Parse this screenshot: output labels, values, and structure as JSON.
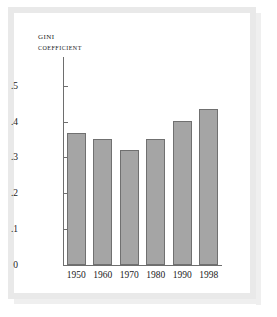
{
  "title": {
    "line1": "Gini",
    "line2": "Coefficient"
  },
  "colors": {
    "bar_fill": "#a5a5a5",
    "bar_stroke": "#707070",
    "axis": "#6e6e6e",
    "text": "#1a1a1a",
    "card_background": "#ffffff",
    "frame": "#e9e9e9"
  },
  "chart_data": {
    "type": "bar",
    "title": "Gini Coefficient",
    "xlabel": "",
    "ylabel": "Gini coefficient",
    "categories": [
      "1950",
      "1960",
      "1970",
      "1980",
      "1990",
      "1998"
    ],
    "values": [
      0.367,
      0.35,
      0.32,
      0.35,
      0.401,
      0.434
    ],
    "ytick_labels": [
      "0",
      ".1",
      ".2",
      ".3",
      ".4",
      ".5"
    ],
    "ytick_values": [
      0,
      0.1,
      0.2,
      0.3,
      0.4,
      0.5
    ],
    "ylim": [
      0,
      0.58
    ],
    "grid": false,
    "legend": false
  }
}
